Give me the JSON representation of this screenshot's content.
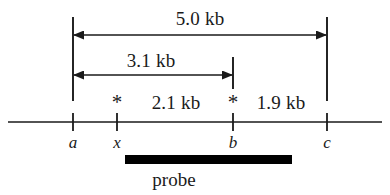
{
  "figure": {
    "line_color": "#1a1a1a",
    "bar_color": "#000000",
    "background": "#ffffff"
  },
  "measurements": [
    {
      "id": "total",
      "label": "5.0 kb",
      "from": "a",
      "to": "c"
    },
    {
      "id": "a-to-b",
      "label": "3.1 kb",
      "from": "a",
      "to": "b"
    },
    {
      "id": "x-to-b",
      "label": "2.1 kb",
      "from": "x",
      "to": "b"
    },
    {
      "id": "b-to-c",
      "label": "1.9 kb",
      "from": "b",
      "to": "c"
    }
  ],
  "loci": [
    {
      "id": "a",
      "label": "a",
      "marked": false
    },
    {
      "id": "x",
      "label": "x",
      "marked": true
    },
    {
      "id": "b",
      "label": "b",
      "marked": true
    },
    {
      "id": "c",
      "label": "c",
      "marked": false
    }
  ],
  "markers": {
    "asterisk": "*",
    "asterisk_left_for": "x",
    "asterisk_right_for": "b"
  },
  "probe": {
    "label": "probe"
  }
}
